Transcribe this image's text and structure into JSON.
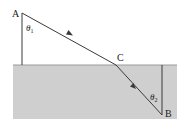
{
  "diagram": {
    "type": "refraction",
    "colors": {
      "medium2": "#cfcfcf",
      "interface": "#9a9a9a",
      "ray": "#3a3a3a",
      "normal": "#3a3a3a",
      "background": "#ffffff"
    },
    "points": {
      "A": {
        "label": "A",
        "x": 22,
        "y": 13
      },
      "C": {
        "label": "C",
        "x": 116,
        "y": 65
      },
      "B": {
        "label": "B",
        "x": 162,
        "y": 115
      }
    },
    "angles": {
      "theta1": {
        "symbol": "θ",
        "subscript": "1"
      },
      "theta2": {
        "symbol": "θ",
        "subscript": "2"
      }
    }
  }
}
